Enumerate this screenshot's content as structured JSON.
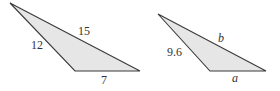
{
  "triangles": [
    {
      "name": "triangle-1",
      "fill": "#e6e6e6",
      "stroke": "#3a3a3a",
      "labels": {
        "left_side": "12",
        "top_side": "15",
        "bottom_side": "7"
      }
    },
    {
      "name": "triangle-2",
      "fill": "#e6e6e6",
      "stroke": "#3a3a3a",
      "labels": {
        "left_side": "9.6",
        "top_side": "b",
        "bottom_side": "a"
      }
    }
  ]
}
